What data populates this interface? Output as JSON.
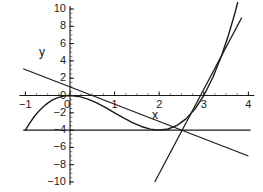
{
  "chart_data": {
    "type": "line",
    "title": "",
    "xlabel": "x",
    "ylabel": "y",
    "xlim": [
      -1,
      4
    ],
    "ylim": [
      -10,
      10
    ],
    "grid": false,
    "legend": "none",
    "axis_color": "#1a1a1a",
    "curve_color": "#1a1a1a",
    "background": "#ffffff",
    "x_ticks": [
      {
        "value": -1,
        "label": "−1"
      },
      {
        "value": 0,
        "label": "0"
      },
      {
        "value": 1,
        "label": "1"
      },
      {
        "value": 2,
        "label": "2"
      },
      {
        "value": 3,
        "label": "3"
      },
      {
        "value": 4,
        "label": "4"
      }
    ],
    "y_ticks": [
      {
        "value": 10,
        "label": "10"
      },
      {
        "value": 8,
        "label": "8"
      },
      {
        "value": 6,
        "label": "6"
      },
      {
        "value": 4,
        "label": "4"
      },
      {
        "value": 2,
        "label": "2"
      },
      {
        "value": 0,
        "label": "0"
      },
      {
        "value": -2,
        "label": "−2"
      },
      {
        "value": -4,
        "label": "−4"
      },
      {
        "value": -6,
        "label": "−6"
      },
      {
        "value": -8,
        "label": "−8"
      },
      {
        "value": -10,
        "label": "−10"
      }
    ],
    "x_minor_tick_step": 0.25,
    "y_minor_tick_step": 0.5,
    "series": [
      {
        "name": "cubic-curve",
        "type": "curve",
        "expression": "x^3 - 3x^2 + 0",
        "points": [
          {
            "x": -1.0,
            "y": -4.0
          },
          {
            "x": -0.9,
            "y": -3.16
          },
          {
            "x": -0.8,
            "y": -2.43
          },
          {
            "x": -0.7,
            "y": -1.81
          },
          {
            "x": -0.6,
            "y": -1.3
          },
          {
            "x": -0.5,
            "y": -0.88
          },
          {
            "x": -0.4,
            "y": -0.54
          },
          {
            "x": -0.3,
            "y": -0.3
          },
          {
            "x": -0.2,
            "y": -0.13
          },
          {
            "x": -0.1,
            "y": -0.03
          },
          {
            "x": 0.0,
            "y": 0.0
          },
          {
            "x": 0.2,
            "y": -0.11
          },
          {
            "x": 0.4,
            "y": -0.42
          },
          {
            "x": 0.6,
            "y": -0.86
          },
          {
            "x": 0.8,
            "y": -1.41
          },
          {
            "x": 1.0,
            "y": -2.0
          },
          {
            "x": 1.2,
            "y": -2.59
          },
          {
            "x": 1.4,
            "y": -3.14
          },
          {
            "x": 1.6,
            "y": -3.58
          },
          {
            "x": 1.8,
            "y": -3.89
          },
          {
            "x": 2.0,
            "y": -4.0
          },
          {
            "x": 2.2,
            "y": -3.87
          },
          {
            "x": 2.4,
            "y": -3.46
          },
          {
            "x": 2.6,
            "y": -2.7
          },
          {
            "x": 2.8,
            "y": -1.57
          },
          {
            "x": 3.0,
            "y": 0.0
          },
          {
            "x": 3.2,
            "y": 2.05
          },
          {
            "x": 3.4,
            "y": 4.62
          },
          {
            "x": 3.55,
            "y": 6.93
          },
          {
            "x": 3.68,
            "y": 9.21
          },
          {
            "x": 3.76,
            "y": 10.75
          }
        ]
      },
      {
        "name": "secant-line-descending",
        "type": "line",
        "expression": "y = -2x + 1",
        "from": {
          "x": -1.05,
          "y": 3.1
        },
        "to": {
          "x": 4.0,
          "y": -7.0
        }
      },
      {
        "name": "tangent-line-steep",
        "type": "line",
        "expression": "y = 9x - 27",
        "from": {
          "x": 1.9,
          "y": -10.0
        },
        "to": {
          "x": 3.85,
          "y": 9.0
        }
      },
      {
        "name": "horizontal-line-minus-four",
        "type": "line",
        "expression": "y = -4",
        "from": {
          "x": -1.05,
          "y": -4.0
        },
        "to": {
          "x": 4.05,
          "y": -4.0
        }
      }
    ]
  },
  "labels": {
    "y_axis_name": "y",
    "x_axis_name": "x"
  }
}
